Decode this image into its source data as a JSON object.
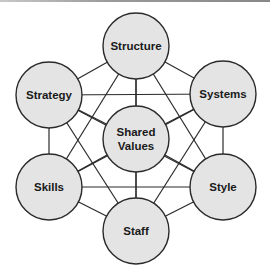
{
  "diagram": {
    "nodes": [
      {
        "id": "structure",
        "lines": [
          "Structure"
        ]
      },
      {
        "id": "strategy",
        "lines": [
          "Strategy"
        ]
      },
      {
        "id": "systems",
        "lines": [
          "Systems"
        ]
      },
      {
        "id": "shared-values",
        "lines": [
          "Shared",
          "Values"
        ]
      },
      {
        "id": "skills",
        "lines": [
          "Skills"
        ]
      },
      {
        "id": "style",
        "lines": [
          "Style"
        ]
      },
      {
        "id": "staff",
        "lines": [
          "Staff"
        ]
      }
    ],
    "edges": "all-pairs",
    "colors": {
      "node_fill": "#e4e4e4",
      "stroke": "#2a2a2a",
      "text": "#1a1a1a"
    }
  }
}
